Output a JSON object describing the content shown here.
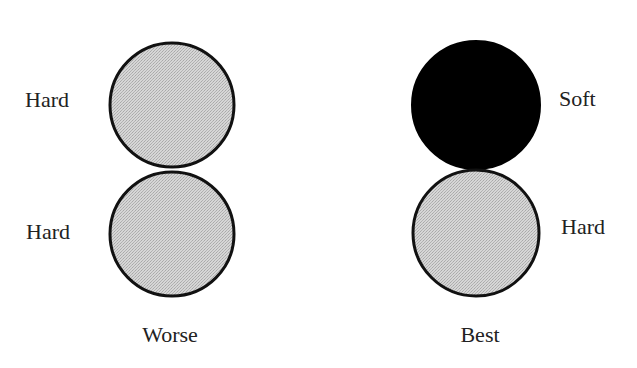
{
  "diagram": {
    "colors": {
      "hard_fill": "#cfcfcf",
      "soft_fill": "#000000",
      "stroke": "#111111",
      "text": "#222222"
    },
    "groups": [
      {
        "caption": "Worse",
        "balls": [
          {
            "position": "top",
            "label": "Hard",
            "type": "hard"
          },
          {
            "position": "bottom",
            "label": "Hard",
            "type": "hard"
          }
        ]
      },
      {
        "caption": "Best",
        "balls": [
          {
            "position": "top",
            "label": "Soft",
            "type": "soft"
          },
          {
            "position": "bottom",
            "label": "Hard",
            "type": "hard"
          }
        ]
      }
    ]
  }
}
